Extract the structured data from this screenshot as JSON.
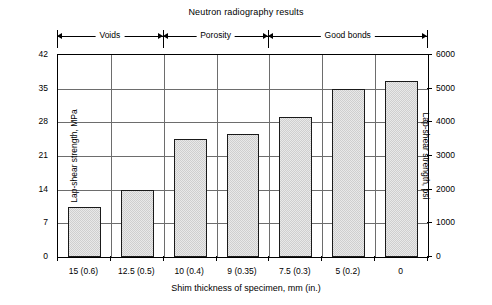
{
  "chart_data": {
    "type": "bar",
    "title": "Neutron radiography results",
    "xlabel": "Shim thickness of specimen, mm (in.)",
    "ylabel": "Lap-shear strength, MPa",
    "ylabel_secondary": "Lap-shear strength, psi",
    "categories": [
      "15 (0.6)",
      "12.5 (0.5)",
      "10 (0.4)",
      "9 (0.35)",
      "7.5 (0.3)",
      "5 (0.2)",
      "0"
    ],
    "values": [
      10.5,
      14.0,
      24.5,
      25.5,
      29.2,
      35.0,
      36.5
    ],
    "values_psi": [
      1520,
      2030,
      3550,
      3700,
      4230,
      5075,
      5290
    ],
    "ylim": [
      0,
      42
    ],
    "ylim_secondary": [
      0,
      6000
    ],
    "yticks": [
      0,
      7,
      14,
      21,
      28,
      35,
      42
    ],
    "yticks_secondary": [
      0,
      1000,
      2000,
      3000,
      4000,
      5000,
      6000
    ],
    "grid": true,
    "legend": "none",
    "annotations": [
      {
        "label": "Voids",
        "start_category": 0,
        "end_category": 1
      },
      {
        "label": "Porosity",
        "start_category": 2,
        "end_category": 3
      },
      {
        "label": "Good bonds",
        "start_category": 4,
        "end_category": 6
      }
    ]
  },
  "caption_remnant": ""
}
